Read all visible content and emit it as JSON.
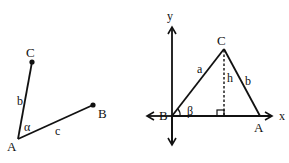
{
  "figure_left": {
    "points": {
      "A": {
        "label": "A",
        "x": 18,
        "y": 139
      },
      "B": {
        "label": "B",
        "x": 93,
        "y": 105
      },
      "C": {
        "label": "C",
        "x": 32,
        "y": 62
      }
    },
    "side_labels": {
      "b": "b",
      "c": "c"
    },
    "angle_label": "α"
  },
  "figure_right": {
    "axes": {
      "x_label": "x",
      "y_label": "y"
    },
    "points": {
      "A": {
        "label": "A",
        "x": 260,
        "y": 116
      },
      "B": {
        "label": "B",
        "x": 172,
        "y": 116
      },
      "C": {
        "label": "C",
        "x": 224,
        "y": 50
      }
    },
    "side_labels": {
      "a": "a",
      "b": "b",
      "h": "h"
    },
    "angle_label": "β"
  },
  "colors": {
    "ink": "#111111",
    "background": "#ffffff"
  }
}
